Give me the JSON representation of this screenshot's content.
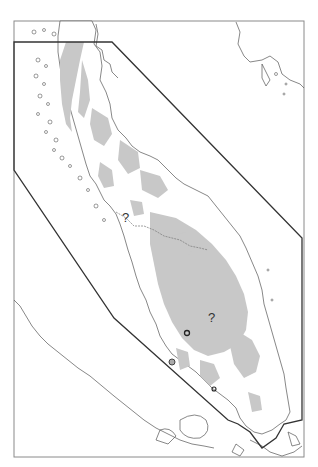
{
  "map": {
    "frame": {
      "x": 14,
      "y": 21,
      "width": 290,
      "height": 436,
      "stroke": "#888888"
    },
    "study_area_polygon": {
      "stroke": "#333333",
      "points": "14,42 112,42 302,238 302,420 284,424 276,438 262,448 250,432 238,424 228,420 114,318 14,170"
    },
    "land_fill": "#ffffff",
    "habitat_fill": "#c8c8c8",
    "coast_stroke": "#555555",
    "labels": [
      {
        "id": "q1",
        "text": "?",
        "x": 122,
        "y": 222
      },
      {
        "id": "q2",
        "text": "?",
        "x": 208,
        "y": 322
      }
    ],
    "markers": [
      {
        "id": "m1",
        "x": 187,
        "y": 333,
        "type": "ring"
      },
      {
        "id": "m2",
        "x": 172,
        "y": 362,
        "type": "ring-filled"
      },
      {
        "id": "m3",
        "x": 214,
        "y": 389,
        "type": "ring"
      }
    ]
  }
}
